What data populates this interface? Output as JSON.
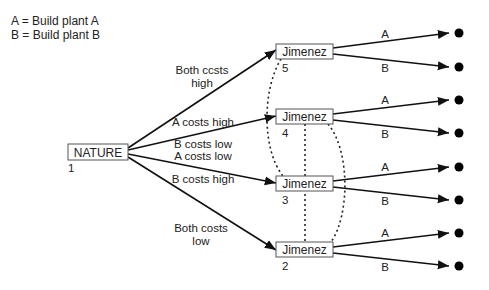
{
  "legend": [
    {
      "text": "A = Build plant A"
    },
    {
      "text": "B = Build plant B"
    }
  ],
  "root": {
    "label": "NATURE",
    "number": "1"
  },
  "nature_branches": [
    {
      "label_lines": [
        "Both ccsts",
        "high"
      ],
      "to": 0
    },
    {
      "label_lines": [
        "A costs high",
        "B costs low"
      ],
      "to": 1
    },
    {
      "label_lines": [
        "A costs low",
        "B costs high"
      ],
      "to": 2
    },
    {
      "label_lines": [
        "Both costs",
        "low"
      ],
      "to": 3
    }
  ],
  "decision_nodes": [
    {
      "label": "Jimenez",
      "number": "5"
    },
    {
      "label": "Jimenez",
      "number": "4"
    },
    {
      "label": "Jimenez",
      "number": "3"
    },
    {
      "label": "Jimenez",
      "number": "2"
    }
  ],
  "action_labels": {
    "a": "A",
    "b": "B"
  },
  "information_set_links": [
    {
      "from": "5",
      "to": "3",
      "style": "dotted-curve-left"
    },
    {
      "from": "4",
      "to": "2",
      "style": "dotted-vertical"
    },
    {
      "from": "4",
      "to": "2",
      "style": "dotted-curve-right"
    }
  ],
  "terminal_nodes": 8,
  "colors": {
    "line": "#111111",
    "box_border": "#555555",
    "text": "#222222",
    "background": "#ffffff"
  }
}
